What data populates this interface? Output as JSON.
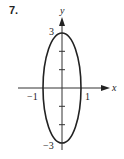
{
  "problem_number": "7.",
  "axes": {
    "x_label": "x",
    "y_label": "y"
  },
  "ticks": {
    "y_top": "3",
    "y_bottom": "−3",
    "x_left": "−1",
    "x_right": "1"
  },
  "curve": {
    "type": "ellipse",
    "center": [
      0,
      0
    ],
    "semi_axis_x": 1,
    "semi_axis_y": 3,
    "color": "#222222"
  }
}
